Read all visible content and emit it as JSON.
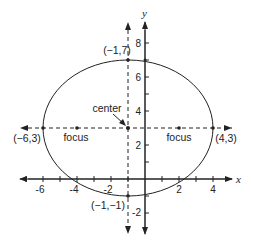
{
  "figure": {
    "type": "ellipse-diagram",
    "axes": {
      "x_label": "x",
      "y_label": "y"
    },
    "x_ticks": [
      {
        "value": -6,
        "label": "-6"
      },
      {
        "value": -4,
        "label": "-4"
      },
      {
        "value": -2,
        "label": "-2"
      },
      {
        "value": 2,
        "label": "2"
      },
      {
        "value": 4,
        "label": "4"
      }
    ],
    "y_ticks": [
      {
        "value": 8,
        "label": "8"
      },
      {
        "value": 6,
        "label": "6"
      },
      {
        "value": 4,
        "label": "4"
      },
      {
        "value": 2,
        "label": "2"
      },
      {
        "value": -2,
        "label": "-2"
      }
    ],
    "ellipse": {
      "center": {
        "x": -1,
        "y": 3
      },
      "semi_major_horizontal": 5,
      "semi_minor_vertical": 4
    },
    "labels": {
      "top_vertex": "(−1,7)",
      "bottom_vertex": "(−1,−1)",
      "left_vertex": "(−6,3)",
      "right_vertex": "(4,3)",
      "center": "center",
      "focus_left": "focus",
      "focus_right": "focus"
    },
    "points": {
      "top_vertex": {
        "x": -1,
        "y": 7
      },
      "bottom_vertex": {
        "x": -1,
        "y": -1
      },
      "left_vertex": {
        "x": -6,
        "y": 3
      },
      "right_vertex": {
        "x": 4,
        "y": 3
      },
      "center": {
        "x": -1,
        "y": 3
      },
      "focus_left": {
        "x": -4,
        "y": 3
      },
      "focus_right": {
        "x": 2,
        "y": 3
      }
    },
    "colors": {
      "stroke": "#222222",
      "background": "#ffffff"
    }
  }
}
